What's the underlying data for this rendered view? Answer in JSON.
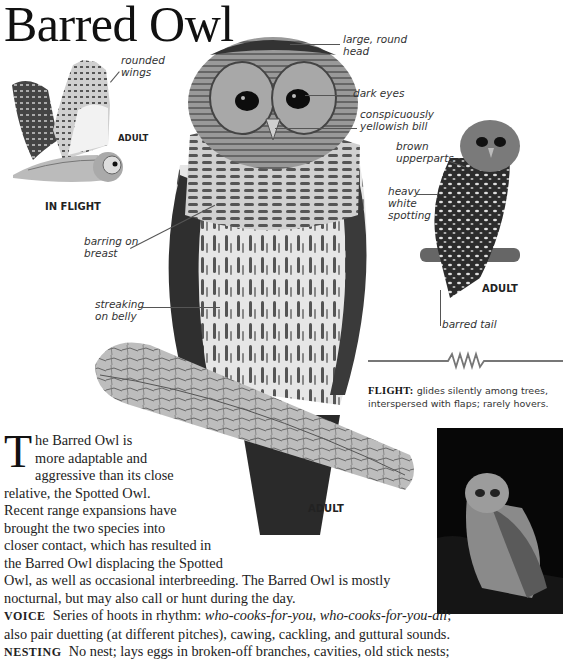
{
  "title": "Barred Owl",
  "illustrations": {
    "in_flight": {
      "caption": "IN FLIGHT",
      "age_label": "ADULT",
      "callouts": [
        "rounded wings"
      ]
    },
    "main_perched": {
      "age_label": "ADULT",
      "callouts": {
        "head": "large, round head",
        "eyes": "dark eyes",
        "bill": "conspicuously yellowish bill",
        "breast": "barring on breast",
        "belly": "streaking on belly"
      }
    },
    "back_view": {
      "age_label": "ADULT",
      "callouts": {
        "upperparts": "brown upperparts",
        "spotting": "heavy white spotting",
        "tail": "barred tail"
      }
    }
  },
  "flight": {
    "label": "FLIGHT:",
    "text": "glides silently among trees, interspersed with flaps; rarely hovers."
  },
  "description": {
    "dropcap": "T",
    "lines": [
      "he Barred Owl is",
      "more adaptable and",
      "aggressive than its close",
      "relative, the Spotted Owl.",
      "Recent range expansions have",
      "brought the two species into",
      "closer contact, which has resulted in",
      "the Barred Owl displacing the Spotted",
      "Owl, as well as occasional interbreeding. The Barred Owl is mostly",
      "nocturnal, but may also call or hunt during the day."
    ]
  },
  "voice": {
    "label": "VOICE",
    "text1": "Series of hoots in rhythm: ",
    "call1": "who-cooks-for-you",
    "sep": ", ",
    "call2": "who-cooks-for-you-all",
    "end": ";",
    "line2": "also pair duetting (at different pitches), cawing, cackling, and guttural sounds."
  },
  "nesting": {
    "label": "NESTING",
    "text": "No nest; lays eggs in broken-off branches, cavities, old stick nests;"
  }
}
